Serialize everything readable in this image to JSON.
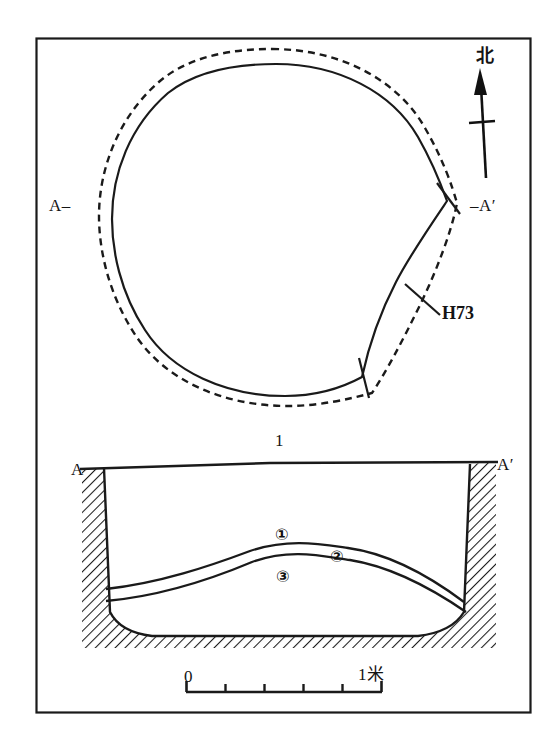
{
  "figure": {
    "number": "1",
    "feature_id": "H73",
    "north_label": "北",
    "background_color": "#ffffff",
    "ink_color": "#141414"
  },
  "plan_view": {
    "name": "plan-view",
    "section_line_left_label": "A–",
    "section_line_right_label": "–A′",
    "feature_callout": "H73",
    "outlines": [
      {
        "name": "pit-mouth-outline",
        "style": "dashed"
      },
      {
        "name": "pit-bottom-outline",
        "style": "solid"
      }
    ]
  },
  "section_view": {
    "name": "section-view",
    "left_label": "A",
    "right_label": "A′",
    "layers": [
      {
        "id": "1",
        "marker": "①"
      },
      {
        "id": "2",
        "marker": "②"
      },
      {
        "id": "3",
        "marker": "③"
      }
    ],
    "fill_pattern": "diagonal-hatch"
  },
  "scale_bar": {
    "name": "scale-bar",
    "start_label": "0",
    "end_label": "1米",
    "divisions": 5,
    "unit": "米"
  }
}
